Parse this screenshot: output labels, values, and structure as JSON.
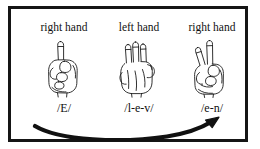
{
  "figure": {
    "border_color": "#151515",
    "background_color": "#ffffff",
    "ink_color": "#111111"
  },
  "columns": [
    {
      "hand_label": "right hand",
      "phonetic": "/E/",
      "hand_icon": "hand-index-finger-up-icon",
      "extended_fingers": 1
    },
    {
      "hand_label": "left hand",
      "phonetic": "/l-e-v/",
      "hand_icon": "hand-three-fingers-up-icon",
      "extended_fingers": 3
    },
    {
      "hand_label": "right hand",
      "phonetic": "/e-n/",
      "hand_icon": "hand-two-fingers-v-icon",
      "extended_fingers": 2
    }
  ],
  "arrow": {
    "icon": "curved-arrow-right-icon",
    "direction": "left-to-right"
  }
}
